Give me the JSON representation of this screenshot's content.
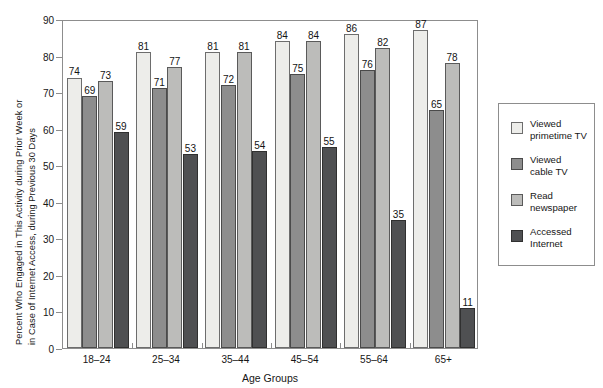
{
  "chart_data": {
    "type": "bar",
    "title": "",
    "xlabel": "Age Groups",
    "ylabel": "Percent Who Engaged in This Activity during Prior Week or in Case of Internet Access, during Previous 30 Days",
    "ylabel_line1": "Percent Who Engaged in This Activity during Prior Week or",
    "ylabel_line2": "in Case of Internet Access, during Previous 30 Days",
    "categories": [
      "18–24",
      "25–34",
      "35–44",
      "45–54",
      "55–64",
      "65+"
    ],
    "series": [
      {
        "name": "Viewed primetime TV",
        "label_line1": "Viewed",
        "label_line2": "primetime TV",
        "color": "#ededea",
        "values": [
          74,
          81,
          81,
          84,
          86,
          87
        ]
      },
      {
        "name": "Viewed cable TV",
        "label_line1": "Viewed",
        "label_line2": "cable TV",
        "color": "#8d8d8d",
        "values": [
          69,
          71,
          72,
          75,
          76,
          65
        ]
      },
      {
        "name": "Read newspaper",
        "label_line1": "Read",
        "label_line2": "newspaper",
        "color": "#bcbcba",
        "values": [
          73,
          77,
          81,
          84,
          82,
          78
        ]
      },
      {
        "name": "Accessed Internet",
        "label_line1": "Accessed",
        "label_line2": "Internet",
        "color": "#4f5052",
        "values": [
          59,
          53,
          54,
          55,
          35,
          11
        ]
      }
    ],
    "ylim": [
      0,
      90
    ],
    "yticks": [
      0,
      10,
      20,
      30,
      40,
      50,
      60,
      70,
      80,
      90
    ],
    "ytick_labels": [
      "0",
      "10",
      "20",
      "30",
      "40",
      "50",
      "60",
      "70",
      "80",
      "90"
    ],
    "grid": false,
    "legend_position": "right-outside"
  }
}
